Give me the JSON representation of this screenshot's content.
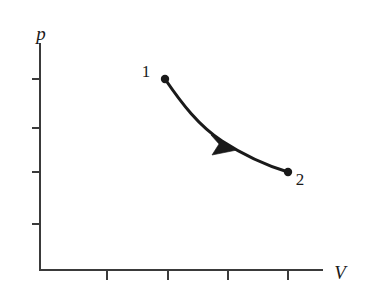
{
  "figure": {
    "kind": "pv-diagram",
    "background_color": "#ffffff",
    "ink_color": "#1a1a1a",
    "axis_color": "#3a3a3a"
  },
  "axes": {
    "y_axis_label": "p",
    "x_axis_label": "V",
    "origin": {
      "x": 40,
      "y": 270
    },
    "y_axis_top": {
      "x": 40,
      "y": 44
    },
    "x_axis_right": {
      "x": 322,
      "y": 270
    },
    "y_tick_positions": [
      79,
      128,
      172,
      224
    ],
    "x_tick_positions": [
      107,
      168,
      228,
      288
    ],
    "tick_length": 9,
    "y_label_position": {
      "x": 36,
      "y": 40
    },
    "x_label_position": {
      "x": 331,
      "y": 279
    },
    "grid": "off",
    "tick_labels": []
  },
  "curve": {
    "name": "process-path",
    "description": "quasi-static expansion from state 1 to state 2",
    "direction": "1 to 2",
    "stroke_width": 3.1,
    "path": "M 165 79 C 182 104, 199 126, 222 141 C 245 156, 268 166, 288 172"
  },
  "arrow": {
    "name": "direction-arrowhead",
    "position": {
      "x": 225,
      "y": 143
    },
    "tip": {
      "x": 237,
      "y": 150
    },
    "points_toward": "2",
    "path": "M 237 150 L 211 135 L 219 144 L 212 155 Z"
  },
  "states": [
    {
      "id": "1",
      "label": "1",
      "point": {
        "x": 165,
        "y": 79
      },
      "dot_radius": 4.2,
      "label_position": {
        "x": 146,
        "y": 77
      }
    },
    {
      "id": "2",
      "label": "2",
      "point": {
        "x": 288,
        "y": 172
      },
      "dot_radius": 4.2,
      "label_position": {
        "x": 296,
        "y": 184
      }
    }
  ],
  "chart_data": {
    "type": "line",
    "title": "",
    "xlabel": "V",
    "ylabel": "p",
    "grid": false,
    "legend": "none",
    "xlim": [
      0,
      367
    ],
    "ylim": [
      0,
      301
    ],
    "annotations": [
      {
        "text": "1",
        "x": 165,
        "y": 79
      },
      {
        "text": "2",
        "x": 288,
        "y": 172
      }
    ],
    "series": [
      {
        "name": "process-1-to-2",
        "x": [
          165,
          180,
          196,
          212,
          228,
          245,
          262,
          275,
          288
        ],
        "y": [
          79,
          101,
          120,
          134,
          145,
          155,
          163,
          168,
          172
        ]
      }
    ],
    "x_ticks": [
      107,
      168,
      228,
      288
    ],
    "y_ticks": [
      79,
      128,
      172,
      224
    ],
    "x_tick_labels": [],
    "y_tick_labels": []
  }
}
